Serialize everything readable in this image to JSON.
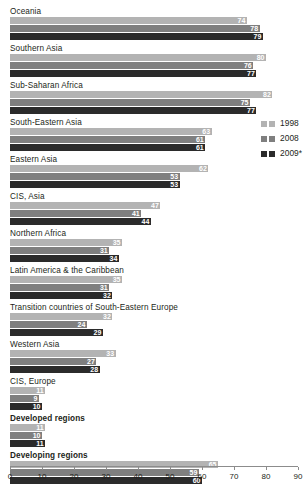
{
  "chart_data": {
    "type": "bar",
    "orientation": "horizontal",
    "title": "",
    "xlabel": "",
    "ylabel": "",
    "xlim": [
      0,
      90
    ],
    "grid": false,
    "legend_position": "right-upper",
    "categories": [
      "Oceania",
      "Southern Asia",
      "Sub-Saharan Africa",
      "South-Eastern Asia",
      "Eastern Asia",
      "CIS, Asia",
      "Northern Africa",
      "Latin America & the Caribbean",
      "Transition countries of South-Eastern Europe",
      "Western Asia",
      "CIS, Europe",
      "Developed regions",
      "Developing regions"
    ],
    "bold_categories": [
      "Developed regions",
      "Developing regions"
    ],
    "series": [
      {
        "name": "1998",
        "color": "#b3b3b3",
        "values": [
          74,
          80,
          82,
          63,
          62,
          47,
          35,
          35,
          32,
          33,
          11,
          11,
          65
        ]
      },
      {
        "name": "2008",
        "color": "#7f7f7f",
        "values": [
          78,
          76,
          75,
          61,
          53,
          41,
          31,
          31,
          24,
          27,
          9,
          10,
          59
        ]
      },
      {
        "name": "2009*",
        "color": "#2b2b2b",
        "values": [
          79,
          77,
          77,
          61,
          53,
          44,
          34,
          32,
          29,
          28,
          10,
          11,
          60
        ]
      }
    ],
    "xticks": [
      0,
      10,
      20,
      30,
      40,
      50,
      60,
      70,
      80,
      90
    ],
    "xticklabels": [
      "0",
      "10",
      "20",
      "30",
      "40",
      "50",
      "60",
      "70",
      "80",
      "90"
    ]
  },
  "legend": {
    "items": [
      {
        "label": "1998"
      },
      {
        "label": "2008"
      },
      {
        "label": "2009*"
      }
    ]
  }
}
